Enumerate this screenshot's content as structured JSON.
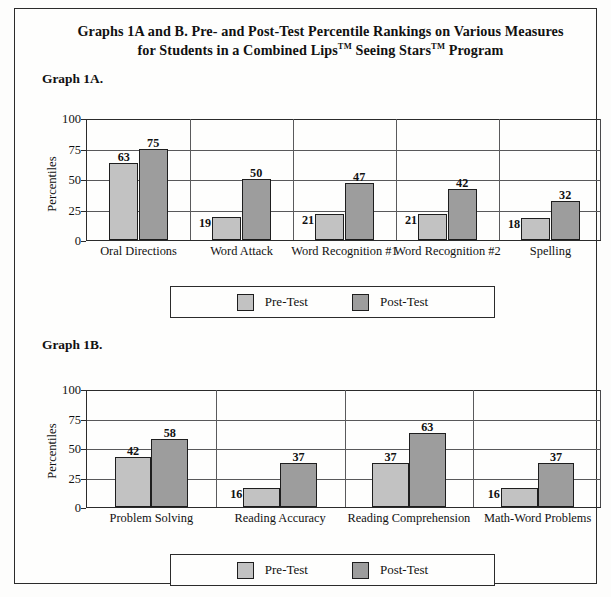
{
  "document": {
    "title_line1": "Graphs 1A and B. Pre- and Post-Test Percentile Rankings on Various Measures",
    "title_line2_a": "for Students in a Combined Lips",
    "title_tm1": "TM",
    "title_line2_b": " Seeing Stars",
    "title_tm2": "TM",
    "title_line2_c": " Program"
  },
  "graph_1a": {
    "label": "Graph 1A."
  },
  "graph_1b": {
    "label": "Graph 1B."
  },
  "legend": {
    "pre_label": "Pre-Test",
    "post_label": "Post-Test",
    "pre_color": "#c2c2c2",
    "post_color": "#9d9d9d"
  },
  "chart_data": [
    {
      "id": "graph_1a",
      "type": "bar",
      "title": "Graph 1A.",
      "xlabel": "",
      "ylabel": "Percentiles",
      "ylim": [
        0,
        100
      ],
      "yticks": [
        0,
        25,
        50,
        75,
        100
      ],
      "grid": true,
      "legend_position": "below",
      "categories": [
        "Oral Directions",
        "Word Attack",
        "Word Recognition #1",
        "Word Recognition #2",
        "Spelling"
      ],
      "series": [
        {
          "name": "Pre-Test",
          "color": "#c2c2c2",
          "values": [
            63,
            19,
            21,
            21,
            18
          ]
        },
        {
          "name": "Post-Test",
          "color": "#9d9d9d",
          "values": [
            75,
            50,
            47,
            42,
            32
          ]
        }
      ]
    },
    {
      "id": "graph_1b",
      "type": "bar",
      "title": "Graph 1B.",
      "xlabel": "",
      "ylabel": "Percentiles",
      "ylim": [
        0,
        100
      ],
      "yticks": [
        0,
        25,
        50,
        75,
        100
      ],
      "grid": true,
      "legend_position": "below",
      "categories": [
        "Problem Solving",
        "Reading Accuracy",
        "Reading Comprehension",
        "Math-Word Problems"
      ],
      "series": [
        {
          "name": "Pre-Test",
          "color": "#c2c2c2",
          "values": [
            42,
            16,
            37,
            16
          ]
        },
        {
          "name": "Post-Test",
          "color": "#9d9d9d",
          "values": [
            58,
            37,
            63,
            37
          ]
        }
      ]
    }
  ]
}
